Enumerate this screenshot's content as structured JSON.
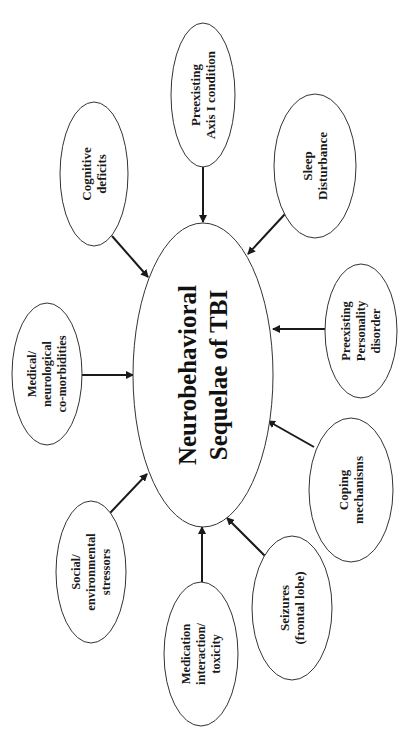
{
  "diagram": {
    "orientation": "rotated -90deg (text reads bottom-to-top)",
    "center": {
      "lines": [
        "Neurobehavioral",
        "Sequelae of TBI"
      ],
      "cx": 203,
      "cy": 375,
      "rx": 70,
      "ry": 152
    },
    "nodes": [
      {
        "id": "preexisting-axis-i",
        "lines": [
          "Preexisting",
          "Axis I condition"
        ],
        "cx": 203,
        "cy": 95,
        "rx": 32,
        "ry": 72
      },
      {
        "id": "sleep-disturbance",
        "lines": [
          "Sleep",
          "Disturbance"
        ],
        "cx": 315,
        "cy": 166,
        "rx": 41,
        "ry": 72
      },
      {
        "id": "preexisting-personality",
        "lines": [
          "Preexisting",
          "Personality",
          "disorder"
        ],
        "cx": 361,
        "cy": 331,
        "rx": 36,
        "ry": 67
      },
      {
        "id": "coping-mechanisms",
        "lines": [
          "Coping",
          "mechanisms"
        ],
        "cx": 351,
        "cy": 490,
        "rx": 42,
        "ry": 72
      },
      {
        "id": "seizures",
        "lines": [
          "Seizures",
          "(frontal lobe)"
        ],
        "cx": 292,
        "cy": 608,
        "rx": 40,
        "ry": 72
      },
      {
        "id": "medication",
        "lines": [
          "Medication",
          "interaction/",
          "toxicity"
        ],
        "cx": 201,
        "cy": 654,
        "rx": 37,
        "ry": 72
      },
      {
        "id": "social-environmental",
        "lines": [
          "Social/",
          "environmental",
          "stressors"
        ],
        "cx": 91,
        "cy": 572,
        "rx": 35,
        "ry": 71
      },
      {
        "id": "medical-neurological",
        "lines": [
          "Medical/",
          "neurological",
          "co-morbidities"
        ],
        "cx": 47,
        "cy": 374,
        "rx": 35,
        "ry": 71
      },
      {
        "id": "cognitive-deficits",
        "lines": [
          "Cognitive",
          "deficits"
        ],
        "cx": 94,
        "cy": 174,
        "rx": 34,
        "ry": 72
      }
    ],
    "arrows": [
      {
        "from": "preexisting-axis-i",
        "x1": 203,
        "y1": 167,
        "x2": 203,
        "y2": 222
      },
      {
        "from": "sleep-disturbance",
        "x1": 285,
        "y1": 214,
        "x2": 248,
        "y2": 254
      },
      {
        "from": "preexisting-personality",
        "x1": 325,
        "y1": 329,
        "x2": 273,
        "y2": 329
      },
      {
        "from": "coping-mechanisms",
        "x1": 314,
        "y1": 447,
        "x2": 268,
        "y2": 421
      },
      {
        "from": "seizures",
        "x1": 265,
        "y1": 556,
        "x2": 227,
        "y2": 518
      },
      {
        "from": "medication",
        "x1": 202,
        "y1": 582,
        "x2": 202,
        "y2": 527
      },
      {
        "from": "social-environmental",
        "x1": 110,
        "y1": 513,
        "x2": 147,
        "y2": 474
      },
      {
        "from": "medical-neurological",
        "x1": 81,
        "y1": 375,
        "x2": 133,
        "y2": 375
      },
      {
        "from": "cognitive-deficits",
        "x1": 112,
        "y1": 236,
        "x2": 148,
        "y2": 277
      }
    ],
    "colors": {
      "background": "#ffffff",
      "stroke": "#333333",
      "text": "#1a1a1a"
    }
  }
}
